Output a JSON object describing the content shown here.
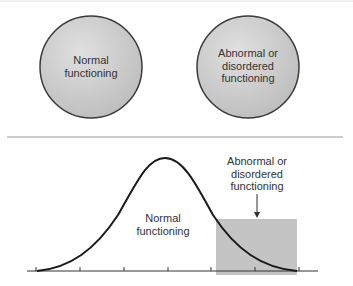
{
  "top_panel": {
    "circles": [
      {
        "label_lines": [
          "Normal",
          "functioning"
        ],
        "cx": 91,
        "cy": 67,
        "r": 51
      },
      {
        "label_lines": [
          "Abnormal or",
          "disordered",
          "functioning"
        ],
        "cx": 248,
        "cy": 67,
        "r": 51
      }
    ],
    "fill_color": "#c8c8c8",
    "stroke_color": "#3a3a3a"
  },
  "bottom_panel": {
    "curve_label": [
      "Normal",
      "functioning"
    ],
    "region_label": [
      "Abnormal or",
      "disordered",
      "functioning"
    ],
    "region_fill": "#c4c4c4",
    "axis_ticks": 7
  }
}
